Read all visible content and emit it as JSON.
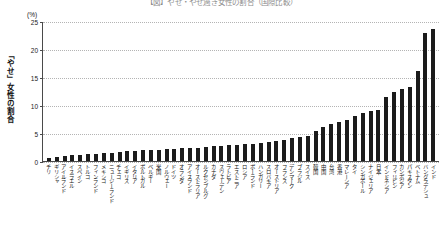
{
  "chart_data": {
    "type": "bar",
    "title": "【図】やせ・やせ過ぎ女性の割合（国際比較）",
    "xlabel": "",
    "ylabel": "「やせ」女性の割合",
    "unit": "(%)",
    "ylim": [
      0,
      25
    ],
    "yticks": [
      0,
      5,
      10,
      15,
      20,
      25
    ],
    "grid": true,
    "legend": "none",
    "categories": [
      "チリ",
      "ギリシャ",
      "アイルランド",
      "イスラエル",
      "スペイン",
      "トルコ",
      "フィンランド",
      "メキシコ",
      "ニュージーランド",
      "チェコ",
      "イギリス",
      "イタリア",
      "ポルトガル",
      "ベルギー",
      "米国",
      "ノルウェー",
      "ドイツ",
      "オランダ",
      "アイスランド",
      "オーストラリア",
      "ルクセンブルグ",
      "カナダ",
      "スウェーデン",
      "ラトビア",
      "エストニア",
      "ロシア",
      "ポーランド",
      "ハンガリー",
      "スロバキア",
      "オーストリア",
      "フランス",
      "デンマーク",
      "ブラジル",
      "スイス",
      "韓国",
      "中国",
      "台湾",
      "香港",
      "マレーシア",
      "タイ",
      "シンガポール",
      "ナイジェリア",
      "日本",
      "インドネシア",
      "フィリピン",
      "カンボジア",
      "パキスタン",
      "ベトナム",
      "バングラデシュ",
      "インド"
    ],
    "values": [
      0.6,
      0.8,
      0.9,
      1.0,
      1.1,
      1.2,
      1.3,
      1.4,
      1.5,
      1.6,
      1.7,
      1.8,
      1.9,
      2.0,
      2.0,
      2.1,
      2.2,
      2.3,
      2.3,
      2.4,
      2.5,
      2.6,
      2.7,
      2.8,
      2.9,
      3.0,
      3.1,
      3.2,
      3.4,
      3.6,
      3.8,
      4.1,
      4.3,
      4.5,
      5.4,
      6.1,
      6.6,
      6.9,
      7.4,
      8.0,
      8.6,
      9.0,
      9.1,
      11.4,
      12.4,
      12.8,
      13.2,
      16.0,
      22.8,
      23.6
    ]
  }
}
